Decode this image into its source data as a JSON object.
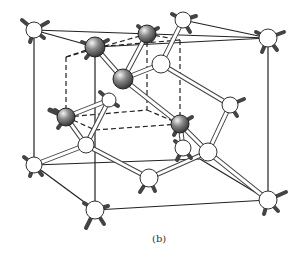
{
  "figure": {
    "caption": "(b)",
    "colors": {
      "line": "#222222",
      "bond_fill": "#ffffff",
      "bond_stroke": "#444444",
      "atom_white": "#ffffff",
      "atom_dark": "#777777"
    }
  }
}
